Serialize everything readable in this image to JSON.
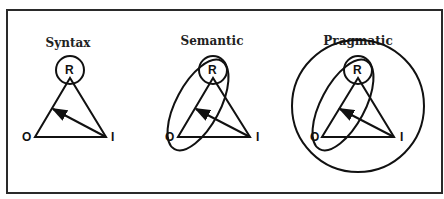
{
  "panels": [
    {
      "title": "Syntax",
      "labels": {
        "r": "R",
        "o": "O",
        "i": "I"
      }
    },
    {
      "title": "Semantic",
      "labels": {
        "r": "R",
        "o": "O",
        "i": "I"
      }
    },
    {
      "title": "Pragmatic",
      "labels": {
        "r": "R",
        "o": "O",
        "i": "I"
      }
    }
  ],
  "colors": {
    "stroke": "#111111",
    "background": "#ffffff"
  }
}
